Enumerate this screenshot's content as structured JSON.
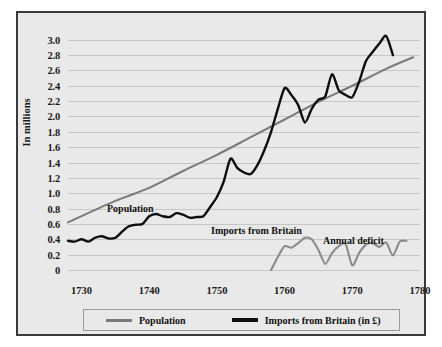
{
  "chart_data": {
    "type": "line",
    "title": "",
    "xlabel": "",
    "ylabel": "In millions",
    "xlim": [
      1728,
      1780
    ],
    "ylim": [
      0,
      3.1
    ],
    "grid": "horizontal",
    "legend_position": "bottom",
    "y_ticks": [
      "0",
      "0.2",
      "0.4",
      "0.6",
      "0.8",
      "1.0",
      "1.2",
      "1.4",
      "1.6",
      "1.8",
      "2.0",
      "2.2",
      "2.4",
      "2.6",
      "2.8",
      "3.0"
    ],
    "y_tick_values": [
      0,
      0.2,
      0.4,
      0.6,
      0.8,
      1.0,
      1.2,
      1.4,
      1.6,
      1.8,
      2.0,
      2.2,
      2.4,
      2.6,
      2.8,
      3.0
    ],
    "x_ticks": [
      "1730",
      "1740",
      "1750",
      "1760",
      "1770",
      "1780"
    ],
    "x_tick_values": [
      1730,
      1740,
      1750,
      1760,
      1770,
      1780
    ],
    "series": [
      {
        "name": "Population",
        "color": "#7a7a7a",
        "x": [
          1728,
          1735,
          1740,
          1745,
          1750,
          1755,
          1760,
          1765,
          1770,
          1775,
          1779
        ],
        "values": [
          0.62,
          0.9,
          1.07,
          1.29,
          1.5,
          1.73,
          1.96,
          2.19,
          2.4,
          2.62,
          2.77
        ]
      },
      {
        "name": "Imports from Britain (in £)",
        "color": "#0d0d0d",
        "x": [
          1728,
          1729,
          1730,
          1731,
          1732,
          1733,
          1734,
          1735,
          1736,
          1737,
          1738,
          1739,
          1740,
          1741,
          1742,
          1743,
          1744,
          1745,
          1746,
          1747,
          1748,
          1749,
          1750,
          1751,
          1752,
          1753,
          1754,
          1755,
          1756,
          1757,
          1758,
          1759,
          1760,
          1761,
          1762,
          1763,
          1764,
          1765,
          1766,
          1767,
          1768,
          1769,
          1770,
          1771,
          1772,
          1773,
          1774,
          1775,
          1776
        ],
        "values": [
          0.38,
          0.37,
          0.4,
          0.37,
          0.42,
          0.44,
          0.41,
          0.42,
          0.5,
          0.57,
          0.59,
          0.6,
          0.7,
          0.73,
          0.7,
          0.69,
          0.74,
          0.72,
          0.68,
          0.69,
          0.7,
          0.82,
          0.95,
          1.15,
          1.45,
          1.33,
          1.27,
          1.25,
          1.37,
          1.56,
          1.8,
          2.1,
          2.37,
          2.28,
          2.15,
          1.92,
          2.1,
          2.22,
          2.26,
          2.55,
          2.34,
          2.28,
          2.25,
          2.45,
          2.72,
          2.84,
          2.95,
          3.05,
          2.8
        ]
      },
      {
        "name": "Annual deficit",
        "color": "#8a8a8a",
        "x": [
          1758,
          1759,
          1760,
          1761,
          1762,
          1763,
          1764,
          1765,
          1766,
          1767,
          1768,
          1769,
          1770,
          1771,
          1772,
          1773,
          1774,
          1775,
          1776,
          1777,
          1778
        ],
        "values": [
          0.0,
          0.17,
          0.31,
          0.29,
          0.35,
          0.42,
          0.4,
          0.26,
          0.08,
          0.22,
          0.31,
          0.34,
          0.06,
          0.22,
          0.33,
          0.35,
          0.3,
          0.36,
          0.19,
          0.37,
          0.38
        ]
      }
    ],
    "annotations": [
      {
        "text": "Population",
        "x": 1735,
        "y": 0.95
      },
      {
        "text": "Imports from Britain",
        "x": 1751,
        "y": 0.68
      },
      {
        "text": "Annual deficit",
        "x": 1768,
        "y": 0.5
      }
    ],
    "legend": [
      {
        "label": "Population",
        "color": "#7a7a7a"
      },
      {
        "label": "Imports from Britain (in £)",
        "color": "#0d0d0d"
      }
    ]
  }
}
